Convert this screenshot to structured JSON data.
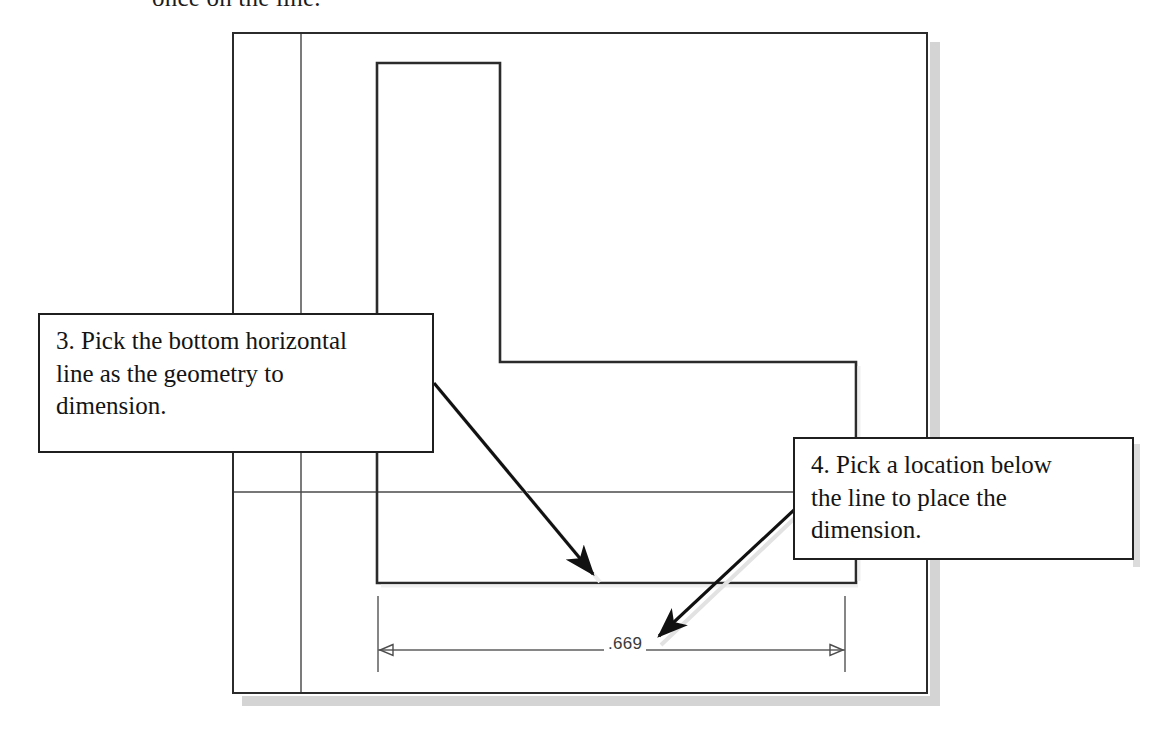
{
  "figure": {
    "kind": "cad-drawing-tutorial-figure",
    "top_clipped_text": "once on the line.",
    "sheet": {
      "name": "drawing-sheet",
      "background_color": "#ffffff",
      "border_color": "#2b2b2b",
      "shadow_color": "#d4d4d4"
    }
  },
  "callouts": [
    {
      "id": "callout-3",
      "step_number": "3",
      "text": "3. Pick the bottom horizontal line as the geometry to dimension.",
      "line1": "3. Pick the bottom horizontal",
      "line2": "line as the geometry to",
      "line3": "dimension."
    },
    {
      "id": "callout-4",
      "step_number": "4",
      "text": "4. Pick a location below the line to place the dimension.",
      "line1": "4. Pick a location below",
      "line2": "the line to place the",
      "line3": "dimension."
    }
  ],
  "dimension": {
    "name": "linear-dimension",
    "value": ".669",
    "units": "inches",
    "style": "architectural-tick-arrowheads",
    "placement": "below-the-bottom-horizontal-line"
  },
  "geometry": {
    "description": "L-shaped profile outline with drawing frame and construction lines",
    "line_color": "#2b2b2b",
    "thin_line_color": "#555555",
    "profile_path": "M377,63 L500,63 L500,362 L856,362 L856,583 L377,583 Z",
    "construction_lines": [
      {
        "name": "vertical-construction-line",
        "x1": 301,
        "y1": 34,
        "x2": 301,
        "y2": 692
      },
      {
        "name": "horizontal-construction-line",
        "x1": 234,
        "y1": 492,
        "x2": 793,
        "y2": 492
      }
    ],
    "dimension_line": {
      "x1": 378,
      "y1": 650,
      "x2": 845,
      "y2": 650
    },
    "extension_lines": [
      {
        "name": "left-extension-line",
        "x": 378,
        "y1": 596,
        "y2": 672
      },
      {
        "name": "right-extension-line",
        "x": 845,
        "y1": 596,
        "y2": 672
      }
    ]
  },
  "leader_arrows": [
    {
      "name": "leader-arrow-step-3",
      "from_x": 434,
      "from_y": 383,
      "to_x": 596,
      "to_y": 578,
      "points_at": "bottom-horizontal-line"
    },
    {
      "name": "leader-arrow-step-4",
      "from_x": 795,
      "from_y": 509,
      "to_x": 655,
      "to_y": 639,
      "points_at": "dimension-placement-location"
    }
  ],
  "colors": {
    "outline": "#2b2b2b",
    "thin_line": "#555555",
    "arrow": "#111111",
    "shadow": "#d4d4d4",
    "text": "#141414",
    "dim_text": "#3a3a3a",
    "background": "#ffffff"
  }
}
